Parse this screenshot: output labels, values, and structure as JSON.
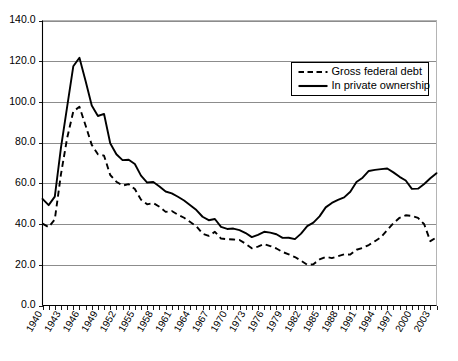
{
  "chart_data": {
    "type": "line",
    "title": "",
    "subtitle": "",
    "xlabel": "",
    "ylabel": "",
    "xlim": [
      1940,
      2004
    ],
    "ylim": [
      0,
      140
    ],
    "grid": true,
    "legend_position": "top-right",
    "y_ticks": [
      "0.0",
      "20.0",
      "40.0",
      "60.0",
      "80.0",
      "100.0",
      "120.0",
      "140.0"
    ],
    "y_tick_values": [
      0,
      20,
      40,
      60,
      80,
      100,
      120,
      140
    ],
    "x_tick_labels": [
      "1940",
      "1943",
      "1946",
      "1949",
      "1952",
      "1955",
      "1958",
      "1961",
      "1964",
      "1967",
      "1970",
      "1973",
      "1976",
      "1979",
      "1982",
      "1985",
      "1988",
      "1991",
      "1994",
      "1997",
      "2000",
      "2003"
    ],
    "x_tick_values": [
      1940,
      1943,
      1946,
      1949,
      1952,
      1955,
      1958,
      1961,
      1964,
      1967,
      1970,
      1973,
      1976,
      1979,
      1982,
      1985,
      1988,
      1991,
      1994,
      1997,
      2000,
      2003
    ],
    "x": [
      1940,
      1941,
      1942,
      1943,
      1944,
      1945,
      1946,
      1947,
      1948,
      1949,
      1950,
      1951,
      1952,
      1953,
      1954,
      1955,
      1956,
      1957,
      1958,
      1959,
      1960,
      1961,
      1962,
      1963,
      1964,
      1965,
      1966,
      1967,
      1968,
      1969,
      1970,
      1971,
      1972,
      1973,
      1974,
      1975,
      1976,
      1977,
      1978,
      1979,
      1980,
      1981,
      1982,
      1983,
      1984,
      1985,
      1986,
      1987,
      1988,
      1989,
      1990,
      1991,
      1992,
      1993,
      1994,
      1995,
      1996,
      1997,
      1998,
      1999,
      2000,
      2001,
      2002,
      2003,
      2004
    ],
    "series": [
      {
        "name": "In private ownership",
        "style": "solid",
        "values": [
          52.4,
          49.3,
          53.5,
          77.6,
          97.6,
          117.5,
          121.7,
          110.3,
          98.2,
          93.1,
          94.1,
          79.7,
          74.3,
          71.4,
          71.6,
          69.5,
          63.8,
          60.4,
          60.7,
          58.5,
          56.0,
          55.1,
          53.4,
          51.6,
          49.3,
          46.9,
          43.6,
          41.9,
          42.5,
          38.6,
          37.6,
          37.8,
          37.0,
          35.6,
          33.6,
          34.7,
          36.2,
          35.8,
          35.0,
          33.2,
          33.3,
          32.6,
          35.3,
          39.0,
          40.7,
          43.8,
          48.2,
          50.4,
          51.9,
          53.1,
          55.9,
          60.7,
          62.8,
          66.1,
          66.6,
          67.0,
          67.3,
          65.4,
          63.2,
          61.4,
          57.3,
          57.4,
          59.7,
          62.5,
          65.0
        ]
      },
      {
        "name": "Gross federal debt",
        "style": "dashed",
        "values": [
          40.2,
          38.5,
          42.3,
          64.5,
          82.2,
          95.3,
          97.6,
          88.4,
          78.9,
          74.3,
          73.6,
          64.1,
          60.8,
          58.9,
          59.6,
          57.2,
          52.0,
          49.7,
          50.3,
          48.5,
          46.0,
          46.4,
          44.6,
          43.1,
          41.0,
          38.9,
          35.3,
          34.2,
          36.2,
          32.9,
          32.6,
          32.4,
          32.2,
          30.3,
          28.1,
          28.9,
          30.2,
          29.2,
          28.0,
          26.3,
          25.1,
          23.8,
          22.0,
          20.0,
          20.3,
          22.6,
          23.9,
          23.3,
          24.2,
          25.1,
          25.0,
          27.4,
          28.3,
          29.7,
          31.6,
          33.6,
          37.1,
          40.4,
          43.1,
          44.3,
          44.0,
          43.0,
          39.9,
          31.6,
          33.5
        ]
      }
    ]
  },
  "legend": {
    "entries": [
      {
        "label": "Gross federal debt",
        "style": "dashed"
      },
      {
        "label": "In private ownership",
        "style": "solid"
      }
    ]
  }
}
